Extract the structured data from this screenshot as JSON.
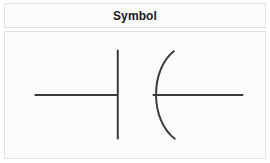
{
  "card": {
    "header": {
      "title": "Symbol"
    },
    "body": {
      "figure_name": "polarized-capacitor-symbol",
      "figure_description": "Electrical schematic symbol: one straight vertical plate and one curved plate with horizontal leads on each side"
    }
  },
  "colors": {
    "page_background": "#ffffff",
    "card_background": "#fbfbfb",
    "card_border": "#e3e3e3",
    "header_text": "#1a1a1a",
    "symbol_stroke": "#3a3a3a"
  },
  "symbol_geometry": {
    "view_box": "0 0 262 128",
    "left_lead": {
      "x1": 29,
      "y1": 64,
      "x2": 113,
      "y2": 64
    },
    "straight_plate": {
      "x": 113,
      "y_top": 18,
      "y_bottom": 109
    },
    "curved_plate": {
      "path": "M 171 19 C 146 38 146 90 172 109",
      "vertex_x": 148
    },
    "right_lead": {
      "x1": 149,
      "y1": 64,
      "x2": 241,
      "y2": 64
    },
    "stroke_width": 2
  }
}
